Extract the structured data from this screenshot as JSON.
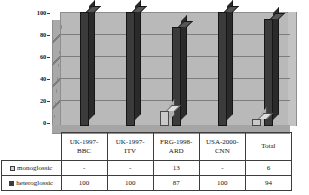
{
  "chart_data": {
    "type": "bar",
    "title": "",
    "xlabel": "",
    "ylabel": "",
    "ylim": [
      0,
      100
    ],
    "yticks": [
      0,
      20,
      40,
      60,
      80,
      100
    ],
    "grid": true,
    "legend_position": "table-left-column",
    "categories": [
      "UK-1997-BBC",
      "UK-1997-ITV",
      "FRG-1998-ARD",
      "USA-2000-CNN",
      "Total"
    ],
    "series": [
      {
        "name": "monoglossic",
        "color": "#cfcfcf",
        "values": [
          null,
          null,
          13,
          null,
          6
        ],
        "display_values": [
          "-",
          "-",
          "13",
          "-",
          "6"
        ]
      },
      {
        "name": "heteroglossic",
        "color": "#3b3b3b",
        "values": [
          100,
          100,
          87,
          100,
          94
        ],
        "display_values": [
          "100",
          "100",
          "87",
          "100",
          "94"
        ]
      }
    ]
  },
  "axis": {
    "tick_100": "100",
    "tick_80": "80",
    "tick_60": "60",
    "tick_40": "40",
    "tick_20": "20",
    "tick_0": "0"
  },
  "table": {
    "categories": [
      "UK-1997-BBC",
      "UK-1997-ITV",
      "FRG-1998-ARD",
      "USA-2000-CNN",
      "Total"
    ],
    "cat_lines": [
      [
        "UK-1997-",
        "BBC"
      ],
      [
        "UK-1997-",
        "ITV"
      ],
      [
        "FRG-1998-",
        "ARD"
      ],
      [
        "USA-2000-",
        "CNN"
      ],
      [
        "Total",
        ""
      ]
    ],
    "rows": [
      {
        "label": "monoglossic",
        "swatch": "light-gray-square-icon",
        "values": [
          "-",
          "-",
          "13",
          "-",
          "6"
        ]
      },
      {
        "label": "heteroglossic",
        "swatch": "dark-gray-square-icon",
        "values": [
          "100",
          "100",
          "87",
          "100",
          "94"
        ]
      }
    ]
  }
}
